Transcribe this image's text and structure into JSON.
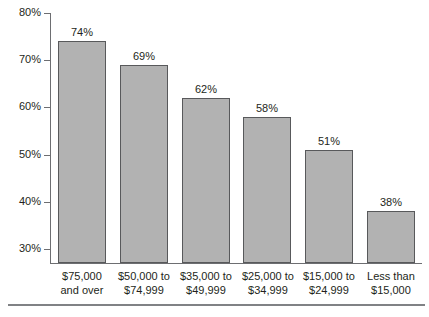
{
  "chart_data": {
    "type": "bar",
    "title": "",
    "subtitle": "",
    "xlabel": "",
    "ylabel": "",
    "ylim": [
      27,
      80
    ],
    "grid": false,
    "legend": null,
    "orientation": "vertical",
    "bar_color": "#b2b2b2",
    "bar_border_color": "#58595b",
    "axis_color": "#6d6e71",
    "categories": [
      "$75,000 and over",
      "$50,000 to $74,999",
      "$35,000 to $49,999",
      "$25,000 to $34,999",
      "$15,000 to $24,999",
      "Less than $15,000"
    ],
    "category_lines": [
      [
        "$75,000",
        "and over"
      ],
      [
        "$50,000 to",
        "$74,999"
      ],
      [
        "$35,000 to",
        "$49,999"
      ],
      [
        "$25,000 to",
        "$34,999"
      ],
      [
        "$15,000 to",
        "$24,999"
      ],
      [
        "Less than",
        "$15,000"
      ]
    ],
    "values": [
      74,
      69,
      62,
      58,
      51,
      38
    ],
    "data_labels": [
      "74%",
      "69%",
      "62%",
      "58%",
      "51%",
      "38%"
    ],
    "ytick_values": [
      30,
      40,
      50,
      60,
      70,
      80
    ],
    "ytick_labels": [
      "30%",
      "40%",
      "50%",
      "60%",
      "70%",
      "80%"
    ]
  },
  "axis": {
    "ticks": [
      {
        "label": "80%",
        "value": 80
      },
      {
        "label": "70%",
        "value": 70
      },
      {
        "label": "60%",
        "value": 60
      },
      {
        "label": "50%",
        "value": 50
      },
      {
        "label": "40%",
        "value": 40
      },
      {
        "label": "30%",
        "value": 30
      }
    ]
  },
  "bars": [
    {
      "label": "74%",
      "value": 74,
      "line1": "$75,000",
      "line2": "and over"
    },
    {
      "label": "69%",
      "value": 69,
      "line1": "$50,000 to",
      "line2": "$74,999"
    },
    {
      "label": "62%",
      "value": 62,
      "line1": "$35,000 to",
      "line2": "$49,999"
    },
    {
      "label": "58%",
      "value": 58,
      "line1": "$25,000 to",
      "line2": "$34,999"
    },
    {
      "label": "51%",
      "value": 51,
      "line1": "$15,000 to",
      "line2": "$24,999"
    },
    {
      "label": "38%",
      "value": 38,
      "line1": "Less than",
      "line2": "$15,000"
    }
  ]
}
